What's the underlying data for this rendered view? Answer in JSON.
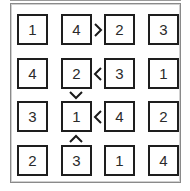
{
  "puzzle": {
    "type": "futoshiki",
    "size": 4,
    "grid": [
      [
        1,
        4,
        2,
        3
      ],
      [
        4,
        2,
        3,
        1
      ],
      [
        3,
        1,
        4,
        2
      ],
      [
        2,
        3,
        1,
        4
      ]
    ],
    "cells": {
      "r0c0": "1",
      "r0c1": "4",
      "r0c2": "2",
      "r0c3": "3",
      "r1c0": "4",
      "r1c1": "2",
      "r1c2": "3",
      "r1c3": "1",
      "r2c0": "3",
      "r2c1": "1",
      "r2c2": "4",
      "r2c3": "2",
      "r3c0": "2",
      "r3c1": "3",
      "r3c2": "1",
      "r3c3": "4"
    },
    "constraints": [
      {
        "between": [
          "r0c1",
          "r0c2"
        ],
        "symbol": ">",
        "icon": "greater-than-icon"
      },
      {
        "between": [
          "r1c1",
          "r1c2"
        ],
        "symbol": "<",
        "icon": "less-than-icon"
      },
      {
        "between": [
          "r1c1",
          "r2c1"
        ],
        "symbol": "v",
        "icon": "chevron-down-icon"
      },
      {
        "between": [
          "r2c1",
          "r2c2"
        ],
        "symbol": "<",
        "icon": "less-than-icon"
      },
      {
        "between": [
          "r2c1",
          "r3c1"
        ],
        "symbol": "^",
        "icon": "chevron-up-icon"
      }
    ]
  },
  "colors": {
    "cell_border": "#1e1e1e",
    "frame_border": "#8a8a8a",
    "digit": "#2a2a2a",
    "background": "#ffffff"
  }
}
